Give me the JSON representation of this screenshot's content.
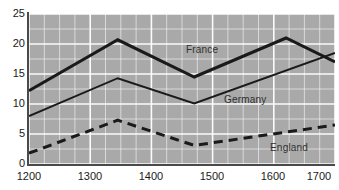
{
  "chart_data": {
    "type": "line",
    "title": "",
    "subtitle": "",
    "xlabel": "",
    "ylabel": "",
    "xlim": [
      1200,
      1700
    ],
    "ylim": [
      0,
      25
    ],
    "grid": true,
    "grid_color": "#ffffff",
    "plot_background": "#a9a9a9",
    "legend_position": "inline-annotations",
    "x_ticks": [
      "1200",
      "1300",
      "1400",
      "1500",
      "1600",
      "1700"
    ],
    "x_tick_values": [
      1200,
      1300,
      1400,
      1500,
      1600,
      1700
    ],
    "y_ticks": [
      "0",
      "5",
      "10",
      "15",
      "20",
      "25"
    ],
    "y_tick_values": [
      0,
      5,
      10,
      15,
      20,
      25
    ],
    "minor_grid_x_step": 25,
    "minor_grid_y_step": 2.5,
    "series": [
      {
        "name": "France",
        "style": "solid",
        "width": 3,
        "color": "#1a1a1a",
        "x": [
          1200,
          1345,
          1470,
          1620,
          1700
        ],
        "values": [
          12.2,
          20.7,
          14.5,
          21.0,
          17.0
        ]
      },
      {
        "name": "Germany",
        "style": "solid",
        "width": 2,
        "color": "#1a1a1a",
        "x": [
          1200,
          1345,
          1470,
          1700
        ],
        "values": [
          8.0,
          14.3,
          10.1,
          18.5
        ]
      },
      {
        "name": "England",
        "style": "dashed",
        "width": 3,
        "color": "#1a1a1a",
        "x": [
          1200,
          1345,
          1470,
          1700
        ],
        "values": [
          1.8,
          7.3,
          3.1,
          6.5
        ]
      }
    ],
    "annotations": [
      {
        "text": "France",
        "series": "France"
      },
      {
        "text": "Germany",
        "series": "Germany"
      },
      {
        "text": "England",
        "series": "England"
      }
    ]
  },
  "labels": {
    "france": "France",
    "germany": "Germany",
    "england": "England"
  },
  "y_ticks": {
    "t0": "0",
    "t1": "5",
    "t2": "10",
    "t3": "15",
    "t4": "20",
    "t5": "25"
  },
  "x_ticks": {
    "t0": "1200",
    "t1": "1300",
    "t2": "1400",
    "t3": "1500",
    "t4": "1600",
    "t5": "1700"
  }
}
